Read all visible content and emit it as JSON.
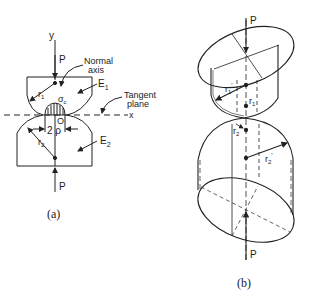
{
  "figure_a": {
    "caption": "(a)",
    "labels": {
      "y_axis": "y",
      "x_axis": "x",
      "load_top": "P",
      "load_bottom": "P",
      "normal_axis_line1": "Normal",
      "normal_axis_line2": "axis",
      "modulus_upper": "E",
      "modulus_upper_sub": "1",
      "modulus_lower": "E",
      "modulus_lower_sub": "2",
      "tangent_plane_line1": "Tangent",
      "tangent_plane_line2": "plane",
      "radius_upper": "r",
      "radius_upper_sub": "1",
      "radius_lower": "r",
      "radius_lower_sub": "2",
      "contact_stress": "σ",
      "contact_stress_sub": "c",
      "origin": "O",
      "contact_width": "2 ρ"
    }
  },
  "figure_b": {
    "caption": "(b)",
    "labels": {
      "load_top": "P",
      "load_bottom": "P",
      "radius_upper_prime": "r",
      "radius_upper_prime_sub": "1",
      "radius_upper_prime_mark": "'",
      "radius_upper": "r",
      "radius_upper_sub": "1",
      "radius_lower": "r",
      "radius_lower_sub": "2",
      "radius_lower_prime": "r",
      "radius_lower_prime_sub": "2",
      "radius_lower_prime_mark": "'"
    }
  },
  "colors": {
    "ink": "#222222",
    "background": "#ffffff"
  }
}
